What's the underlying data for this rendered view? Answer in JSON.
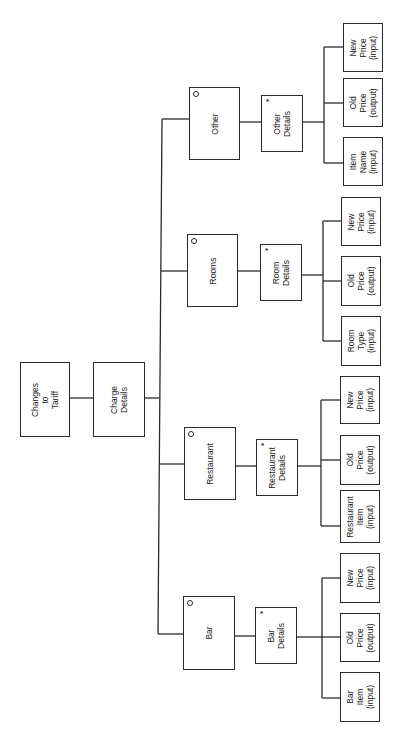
{
  "diagram": {
    "type": "jackson-structure-diagram",
    "orientation": "rotated-90-ccw",
    "root": {
      "label": "Changes\nto\nTariff"
    },
    "level1": {
      "label": "Charge\nDetails"
    },
    "branches": [
      {
        "key": "other",
        "label": "Other",
        "marker": "o",
        "details": {
          "label": "Other\nDetails",
          "marker": "*"
        },
        "leaves": [
          {
            "label": "New\nPrice\n(input)"
          },
          {
            "label": "Old\nPrice\n(output)"
          },
          {
            "label": "Item\nName\n(input)"
          }
        ]
      },
      {
        "key": "rooms",
        "label": "Rooms",
        "marker": "o",
        "details": {
          "label": "Room\nDetails",
          "marker": "*"
        },
        "leaves": [
          {
            "label": "New\nPrice\n(input)"
          },
          {
            "label": "Old\nPrice\n(output)"
          },
          {
            "label": "Room\nType\n(input)"
          }
        ]
      },
      {
        "key": "restaurant",
        "label": "Restaurant",
        "marker": "o",
        "details": {
          "label": "Restaurant\nDetails",
          "marker": "*"
        },
        "leaves": [
          {
            "label": "New\nPrice\n(input)"
          },
          {
            "label": "Old\nPrice\n(output)"
          },
          {
            "label": "Restaurant\nItem\n(input)"
          }
        ]
      },
      {
        "key": "bar",
        "label": "Bar",
        "marker": "o",
        "details": {
          "label": "Bar\nDetails",
          "marker": "*"
        },
        "leaves": [
          {
            "label": "New\nPrice\n(input)"
          },
          {
            "label": "Old\nPrice\n(output)"
          },
          {
            "label": "Bar\nItem\n(input)"
          }
        ]
      }
    ]
  },
  "colors": {
    "line": "#2a2a2a",
    "background": "#ffffff",
    "text": "#1a1a1a"
  }
}
